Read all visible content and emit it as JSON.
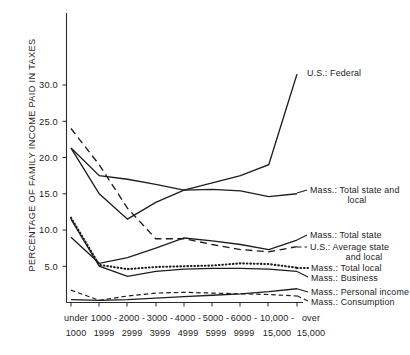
{
  "chart_data": {
    "type": "line",
    "title": "",
    "subtitle": "",
    "xlabel": "",
    "ylabel": "PERCENTAGE OF FAMILY INCOME PAID IN TAXES",
    "categories": [
      "under 1000",
      "1000-1999",
      "2000-2999",
      "3000-3999",
      "4000-4999",
      "5000-5999",
      "6000-9999",
      "10,000-15,000",
      "over 15,000"
    ],
    "xtick_labels_top": [
      "under",
      "1000 -",
      "2000 -",
      "3000 -",
      "4000 -",
      "5000 -",
      "6000 -",
      "10,000 -",
      "over"
    ],
    "xtick_labels_bottom": [
      "1000",
      "1999",
      "2999",
      "3999",
      "4999",
      "5999",
      "9999",
      "15,000",
      "15,000"
    ],
    "ytick_labels": [
      "5.0",
      "10.0",
      "15.0",
      "20.0",
      "25.0",
      "30.0"
    ],
    "ytick_values": [
      5,
      10,
      15,
      20,
      25,
      30
    ],
    "ylim": [
      0,
      35
    ],
    "grid": false,
    "legend_position": "right-inline-annotations",
    "series": [
      {
        "name": "U.S.: Federal",
        "style": "solid",
        "label": "U.S.: Federal",
        "values": [
          21.3,
          15.0,
          11.5,
          13.8,
          15.5,
          16.5,
          17.5,
          19.0,
          31.5
        ]
      },
      {
        "name": "Mass.: Total state and local",
        "style": "solid",
        "label": "Mass.: Total state and",
        "label_line2": "local",
        "values": [
          21.3,
          17.5,
          17.0,
          16.3,
          15.5,
          15.6,
          15.4,
          14.6,
          15.0
        ]
      },
      {
        "name": "Mass.: Total state",
        "style": "solid",
        "label": "Mass.: Total state",
        "values": [
          9.0,
          5.4,
          6.2,
          7.5,
          8.9,
          8.5,
          8.0,
          7.3,
          8.6
        ]
      },
      {
        "name": "U.S.: Average state and local",
        "style": "dashed",
        "label": "U.S.: Average state",
        "label_line2": "and local",
        "values": [
          24.0,
          19.0,
          13.0,
          8.8,
          8.8,
          8.0,
          7.3,
          7.0,
          7.7
        ]
      },
      {
        "name": "Mass.: Total local",
        "style": "dotted",
        "label": "Mass.: Total local",
        "values": [
          11.7,
          5.2,
          4.6,
          4.9,
          5.0,
          5.1,
          5.4,
          5.3,
          4.8
        ]
      },
      {
        "name": "Mass.: Business",
        "style": "solid",
        "label": "Mass.: Business",
        "values": [
          11.5,
          5.0,
          3.6,
          4.3,
          4.6,
          4.7,
          4.7,
          4.6,
          4.3
        ]
      },
      {
        "name": "Mass.: Personal income",
        "style": "solid",
        "label": "Mass.: Personal income",
        "values": [
          0.4,
          0.3,
          0.4,
          0.6,
          0.8,
          1.0,
          1.2,
          1.5,
          1.9
        ]
      },
      {
        "name": "Mass.: Consumption",
        "style": "dashed-small",
        "label": "Mass.: Consumption",
        "values": [
          1.7,
          0.3,
          0.9,
          1.3,
          1.4,
          1.3,
          1.2,
          1.1,
          0.9
        ]
      }
    ],
    "annotations": [
      "U.S.: Federal",
      "Mass.: Total state and local",
      "Mass.: Total state",
      "U.S.: Average state and local",
      "Mass.: Total local",
      "Mass.: Business",
      "Mass.: Personal income",
      "Mass.: Consumption"
    ],
    "colors": {
      "line": "#1d1d1d",
      "axis": "#2b2b2b",
      "background": "#ffffff"
    }
  }
}
